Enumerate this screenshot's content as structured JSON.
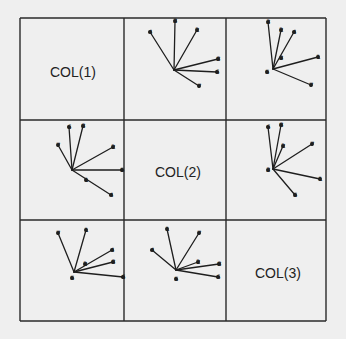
{
  "figure": {
    "background": "#efefef",
    "line_color": "#1e1e1e",
    "grid": {
      "cols": [
        20,
        124,
        226,
        326
      ],
      "rows": [
        18,
        120,
        220,
        321
      ]
    },
    "diagonal_labels": [
      {
        "text": "COL(1)",
        "x": 50,
        "y": 77
      },
      {
        "text": "COL(2)",
        "x": 155,
        "y": 177
      },
      {
        "text": "COL(3)",
        "x": 255,
        "y": 278
      }
    ]
  },
  "chart_data": {
    "type": "scatter",
    "title": "",
    "variables": [
      "COL(1)",
      "COL(2)",
      "COL(3)"
    ],
    "panels": [
      {
        "row": 0,
        "col": 1,
        "center": [
          174,
          70
        ],
        "rays": [
          {
            "label": "4",
            "end": [
              150,
              32
            ]
          },
          {
            "label": "3",
            "end": [
              175,
              21
            ]
          },
          {
            "label": "2",
            "end": [
              197,
              30
            ]
          },
          {
            "label": "8",
            "end": [
              218,
              59
            ]
          },
          {
            "label": "6",
            "end": [
              217,
              72
            ]
          },
          {
            "label": "7",
            "end": [
              199,
              86
            ]
          }
        ],
        "inner_labels": []
      },
      {
        "row": 0,
        "col": 2,
        "center": [
          273,
          69
        ],
        "rays": [
          {
            "label": "3",
            "end": [
              268,
              22
            ]
          },
          {
            "label": "2",
            "end": [
              281,
              30
            ]
          },
          {
            "label": "4",
            "end": [
              294,
              32
            ]
          },
          {
            "label": "1",
            "end": [
              318,
              57
            ]
          },
          {
            "label": "7",
            "end": [
              311,
              85
            ]
          }
        ],
        "inner_labels": [
          {
            "label": "3",
            "pos": [
              281,
              58
            ]
          },
          {
            "label": "5",
            "pos": [
              267,
              72
            ]
          }
        ]
      },
      {
        "row": 1,
        "col": 0,
        "center": [
          72,
          170
        ],
        "rays": [
          {
            "label": "7",
            "end": [
              58,
              145
            ]
          },
          {
            "label": "6",
            "end": [
              69,
              127
            ]
          },
          {
            "label": "8",
            "end": [
              83,
              126
            ]
          },
          {
            "label": "2",
            "end": [
              113,
              147
            ]
          },
          {
            "label": "5",
            "end": [
              122,
              170
            ]
          },
          {
            "label": "4",
            "end": [
              111,
              195
            ]
          }
        ],
        "inner_labels": [
          {
            "label": "1",
            "pos": [
              86,
              180
            ]
          }
        ]
      },
      {
        "row": 1,
        "col": 2,
        "center": [
          273,
          169
        ],
        "rays": [
          {
            "label": "6",
            "end": [
              268,
              127
            ]
          },
          {
            "label": "8",
            "end": [
              281,
              125
            ]
          },
          {
            "label": "2",
            "end": [
              283,
              146
            ]
          },
          {
            "label": "7",
            "end": [
              312,
              144
            ]
          },
          {
            "label": "1",
            "end": [
              320,
              179
            ]
          },
          {
            "label": "5",
            "end": [
              295,
              195
            ]
          }
        ],
        "inner_labels": [
          {
            "label": "3",
            "pos": [
              268,
              170
            ]
          }
        ]
      },
      {
        "row": 2,
        "col": 0,
        "center": [
          74,
          272
        ],
        "rays": [
          {
            "label": "7",
            "end": [
              58,
              233
            ]
          },
          {
            "label": "1",
            "end": [
              86,
              230
            ]
          },
          {
            "label": "4",
            "end": [
              112,
              250
            ]
          },
          {
            "label": "8",
            "end": [
              113,
              262
            ]
          },
          {
            "label": "6",
            "end": [
              123,
              277
            ]
          }
        ],
        "inner_labels": [
          {
            "label": "2",
            "pos": [
              85,
              264
            ]
          },
          {
            "label": "5",
            "pos": [
              72,
              278
            ]
          }
        ]
      },
      {
        "row": 2,
        "col": 1,
        "center": [
          176,
          270
        ],
        "rays": [
          {
            "label": "4",
            "end": [
              152,
              250
            ]
          },
          {
            "label": "1",
            "end": [
              167,
              229
            ]
          },
          {
            "label": "7",
            "end": [
              199,
              233
            ]
          },
          {
            "label": "2",
            "end": [
              198,
              262
            ]
          },
          {
            "label": "8",
            "end": [
              219,
              264
            ]
          },
          {
            "label": "6",
            "end": [
              218,
              277
            ]
          }
        ],
        "inner_labels": [
          {
            "label": "5",
            "pos": [
              176,
              279
            ]
          }
        ]
      }
    ]
  }
}
